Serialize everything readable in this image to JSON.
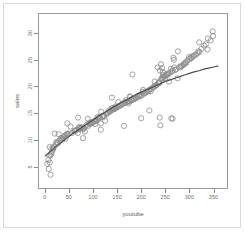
{
  "figure": {
    "background_color": "#ffffff",
    "frame_color": "#9a9a9a",
    "outer_border_color": "#d9d9d9"
  },
  "chart_data": {
    "type": "scatter",
    "title": "",
    "xlabel": "youtube",
    "ylabel": "sales",
    "xlim": [
      -12,
      378
    ],
    "ylim": [
      1.0,
      33.5
    ],
    "grid": false,
    "legend": null,
    "marker": {
      "shape": "open-circle",
      "color": "#8c8c8c",
      "size": 2.6,
      "fill": "none"
    },
    "fit_line": {
      "name": "smoothed fit",
      "color": "#4d4d4d",
      "width": 1.2,
      "points": [
        [
          0,
          6.9
        ],
        [
          10,
          7.7
        ],
        [
          20,
          8.5
        ],
        [
          30,
          9.2
        ],
        [
          40,
          9.9
        ],
        [
          50,
          10.6
        ],
        [
          60,
          11.3
        ],
        [
          70,
          11.9
        ],
        [
          80,
          12.5
        ],
        [
          90,
          13.1
        ],
        [
          100,
          13.7
        ],
        [
          110,
          14.3
        ],
        [
          120,
          14.9
        ],
        [
          130,
          15.4
        ],
        [
          140,
          16.0
        ],
        [
          150,
          16.5
        ],
        [
          160,
          17.0
        ],
        [
          170,
          17.5
        ],
        [
          180,
          18.0
        ],
        [
          190,
          18.5
        ],
        [
          200,
          18.9
        ],
        [
          210,
          19.3
        ],
        [
          220,
          19.7
        ],
        [
          230,
          20.1
        ],
        [
          240,
          20.5
        ],
        [
          250,
          20.9
        ],
        [
          260,
          21.2
        ],
        [
          270,
          21.5
        ],
        [
          280,
          21.8
        ],
        [
          290,
          22.1
        ],
        [
          300,
          22.4
        ],
        [
          310,
          22.7
        ],
        [
          320,
          22.9
        ],
        [
          330,
          23.2
        ],
        [
          340,
          23.4
        ],
        [
          350,
          23.6
        ],
        [
          360,
          23.8
        ]
      ]
    },
    "x_ticks": [
      0,
      50,
      100,
      150,
      200,
      250,
      300,
      350
    ],
    "y_ticks": [
      5,
      10,
      15,
      20,
      25,
      30
    ],
    "x_tick_labels": [
      "0",
      "50",
      "100",
      "150",
      "200",
      "250",
      "300",
      "350"
    ],
    "y_tick_labels": [
      "5",
      "10",
      "15",
      "20",
      "25",
      "30"
    ],
    "n_points": 200,
    "points": [
      [
        276.12,
        26.52
      ],
      [
        53.4,
        12.48
      ],
      [
        20.64,
        11.16
      ],
      [
        181.8,
        22.2
      ],
      [
        216.96,
        15.48
      ],
      [
        10.44,
        8.64
      ],
      [
        69.0,
        14.16
      ],
      [
        144.24,
        15.84
      ],
      [
        10.32,
        5.76
      ],
      [
        239.76,
        12.72
      ],
      [
        79.32,
        10.32
      ],
      [
        257.64,
        20.88
      ],
      [
        28.64,
        11.04
      ],
      [
        117.0,
        15.24
      ],
      [
        244.92,
        22.68
      ],
      [
        234.48,
        23.52
      ],
      [
        81.36,
        12.12
      ],
      [
        337.68,
        26.88
      ],
      [
        83.04,
        11.52
      ],
      [
        176.76,
        18.12
      ],
      [
        262.08,
        23.28
      ],
      [
        248.88,
        21.48
      ],
      [
        70.8,
        12.36
      ],
      [
        240.96,
        24.12
      ],
      [
        243.24,
        23.4
      ],
      [
        68.52,
        11.28
      ],
      [
        125.04,
        13.56
      ],
      [
        44.64,
        10.92
      ],
      [
        275.4,
        21.48
      ],
      [
        89.16,
        13.92
      ],
      [
        320.28,
        28.2
      ],
      [
        266.88,
        25.32
      ],
      [
        74.4,
        12.36
      ],
      [
        43.2,
        10.2
      ],
      [
        168.48,
        17.4
      ],
      [
        139.32,
        17.88
      ],
      [
        90.0,
        12.6
      ],
      [
        15.84,
        8.52
      ],
      [
        177.12,
        18.0
      ],
      [
        244.08,
        21.24
      ],
      [
        116.4,
        13.08
      ],
      [
        348.24,
        30.24
      ],
      [
        179.88,
        17.52
      ],
      [
        133.2,
        15.48
      ],
      [
        228.0,
        20.88
      ],
      [
        268.56,
        23.52
      ],
      [
        36.96,
        10.08
      ],
      [
        104.4,
        12.96
      ],
      [
        173.52,
        16.8
      ],
      [
        292.2,
        24.48
      ],
      [
        11.88,
        7.08
      ],
      [
        152.28,
        17.04
      ],
      [
        112.68,
        14.16
      ],
      [
        106.8,
        13.56
      ],
      [
        219.96,
        19.08
      ],
      [
        46.08,
        11.04
      ],
      [
        245.04,
        22.08
      ],
      [
        200.76,
        18.24
      ],
      [
        24.24,
        9.6
      ],
      [
        79.2,
        12.0
      ],
      [
        109.8,
        14.28
      ],
      [
        9.6,
        7.08
      ],
      [
        236.88,
        20.76
      ],
      [
        61.2,
        11.64
      ],
      [
        203.88,
        19.32
      ],
      [
        239.04,
        22.92
      ],
      [
        141.12,
        15.96
      ],
      [
        17.4,
        8.4
      ],
      [
        267.96,
        24.96
      ],
      [
        138.72,
        15.84
      ],
      [
        338.4,
        28.92
      ],
      [
        299.04,
        25.44
      ],
      [
        203.4,
        18.96
      ],
      [
        27.36,
        9.36
      ],
      [
        185.4,
        17.64
      ],
      [
        123.0,
        14.52
      ],
      [
        279.96,
        23.64
      ],
      [
        321.0,
        26.4
      ],
      [
        146.52,
        16.2
      ],
      [
        56.28,
        11.28
      ],
      [
        184.92,
        17.64
      ],
      [
        33.36,
        10.32
      ],
      [
        218.04,
        19.44
      ],
      [
        287.4,
        24.0
      ],
      [
        167.4,
        17.04
      ],
      [
        47.04,
        11.16
      ],
      [
        302.64,
        25.32
      ],
      [
        253.44,
        22.32
      ],
      [
        92.64,
        13.2
      ],
      [
        209.16,
        18.84
      ],
      [
        71.16,
        12.0
      ],
      [
        190.08,
        17.88
      ],
      [
        129.96,
        15.0
      ],
      [
        272.64,
        23.16
      ],
      [
        14.28,
        7.68
      ],
      [
        235.92,
        20.52
      ],
      [
        163.44,
        16.8
      ],
      [
        62.04,
        11.64
      ],
      [
        316.44,
        26.16
      ],
      [
        105.6,
        13.68
      ],
      [
        197.28,
        18.36
      ],
      [
        40.32,
        10.68
      ],
      [
        295.8,
        24.84
      ],
      [
        158.88,
        16.56
      ],
      [
        224.88,
        19.8
      ],
      [
        87.24,
        12.84
      ],
      [
        348.96,
        29.4
      ],
      [
        131.64,
        15.12
      ],
      [
        257.04,
        22.44
      ],
      [
        7.56,
        6.24
      ],
      [
        180.0,
        17.4
      ],
      [
        310.56,
        25.8
      ],
      [
        119.52,
        14.4
      ],
      [
        244.8,
        21.72
      ],
      [
        66.48,
        11.88
      ],
      [
        207.36,
        18.72
      ],
      [
        154.32,
        16.32
      ],
      [
        285.0,
        23.88
      ],
      [
        30.12,
        9.84
      ],
      [
        172.2,
        17.16
      ],
      [
        228.84,
        20.04
      ],
      [
        98.04,
        13.32
      ],
      [
        330.6,
        27.6
      ],
      [
        143.88,
        15.72
      ],
      [
        263.76,
        22.8
      ],
      [
        18.72,
        8.64
      ],
      [
        192.72,
        18.0
      ],
      [
        306.12,
        25.56
      ],
      [
        111.24,
        14.04
      ],
      [
        249.6,
        21.96
      ],
      [
        75.48,
        12.24
      ],
      [
        213.48,
        19.08
      ],
      [
        149.76,
        16.08
      ],
      [
        290.52,
        24.24
      ],
      [
        38.52,
        10.44
      ],
      [
        165.96,
        16.92
      ],
      [
        232.2,
        20.28
      ],
      [
        101.64,
        13.44
      ],
      [
        325.2,
        27.0
      ],
      [
        136.44,
        15.36
      ],
      [
        270.12,
        23.04
      ],
      [
        22.56,
        9.12
      ],
      [
        196.56,
        18.12
      ],
      [
        313.68,
        25.92
      ],
      [
        114.96,
        14.16
      ],
      [
        252.24,
        22.08
      ],
      [
        84.12,
        12.48
      ],
      [
        216.24,
        19.2
      ],
      [
        157.08,
        16.44
      ],
      [
        283.08,
        23.76
      ],
      [
        42.24,
        10.8
      ],
      [
        170.28,
        17.04
      ],
      [
        226.44,
        19.92
      ],
      [
        95.28,
        13.08
      ],
      [
        344.04,
        28.56
      ],
      [
        127.8,
        14.76
      ],
      [
        260.28,
        22.56
      ],
      [
        13.56,
        7.32
      ],
      [
        188.64,
        17.76
      ],
      [
        299.88,
        25.08
      ],
      [
        108.12,
        13.8
      ],
      [
        241.56,
        21.36
      ],
      [
        72.36,
        12.12
      ],
      [
        211.08,
        18.96
      ],
      [
        148.32,
        15.96
      ],
      [
        288.84,
        24.12
      ],
      [
        35.76,
        10.2
      ],
      [
        161.52,
        16.68
      ],
      [
        230.76,
        20.16
      ],
      [
        99.6,
        13.2
      ],
      [
        334.08,
        27.84
      ],
      [
        140.04,
        15.6
      ],
      [
        265.2,
        22.92
      ],
      [
        25.2,
        9.48
      ],
      [
        194.64,
        18.24
      ],
      [
        308.4,
        25.68
      ],
      [
        122.16,
        14.28
      ],
      [
        247.32,
        21.84
      ],
      [
        77.64,
        12.24
      ],
      [
        222.0,
        19.56
      ],
      [
        151.92,
        16.2
      ],
      [
        293.52,
        24.36
      ],
      [
        49.2,
        11.16
      ],
      [
        174.96,
        17.28
      ],
      [
        237.6,
        20.64
      ],
      [
        93.84,
        12.96
      ],
      [
        318.72,
        26.52
      ],
      [
        134.76,
        15.24
      ],
      [
        255.36,
        22.2
      ],
      [
        16.92,
        8.16
      ],
      [
        183.12,
        17.52
      ],
      [
        304.2,
        25.2
      ],
      [
        103.2,
        13.44
      ],
      [
        243.0,
        21.48
      ],
      [
        64.56,
        11.76
      ],
      [
        205.8,
        18.6
      ],
      [
        145.68,
        15.84
      ],
      [
        281.64,
        23.52
      ],
      [
        31.8,
        9.96
      ],
      [
        176.04,
        17.16
      ],
      [
        12.0,
        3.48
      ],
      [
        8.16,
        4.56
      ],
      [
        5.04,
        5.52
      ],
      [
        238.44,
        14.16
      ],
      [
        262.56,
        14.04
      ],
      [
        199.92,
        14.04
      ],
      [
        116.04,
        11.88
      ],
      [
        164.4,
        12.6
      ],
      [
        46.8,
        13.08
      ],
      [
        265.08,
        13.92
      ]
    ]
  }
}
